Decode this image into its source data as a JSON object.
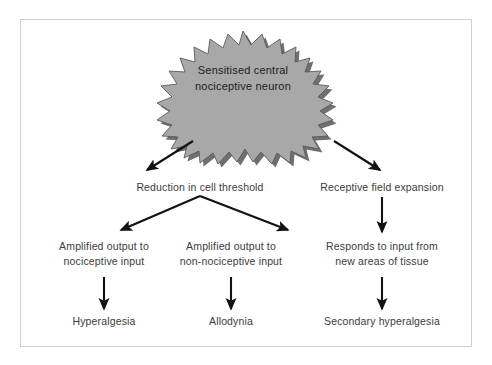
{
  "diagram": {
    "type": "flowchart",
    "title": "Sensitised central nociceptive neuron",
    "frame": {
      "border_color": "#cfcfcf",
      "background": "#ffffff"
    },
    "burst": {
      "shape": "starburst",
      "fill_color": "#a8a8a8",
      "shadow_color": "#6f6f6f",
      "outline_color": "#5a5a5a",
      "text_color": "#1c1c1c",
      "line1": "Sensitised central",
      "line2": "nociceptive neuron"
    },
    "arrow_color": "#121212",
    "label_color": "#3b3b3b",
    "tier1": [
      {
        "id": "reduction",
        "text": "Reduction in cell threshold"
      },
      {
        "id": "receptive",
        "text": "Receptive field expansion"
      }
    ],
    "tier2": [
      {
        "id": "amp-noci",
        "line1": "Amplified output to",
        "line2": "nociceptive input"
      },
      {
        "id": "amp-nonnoci",
        "line1": "Amplified output to",
        "line2": "non-nociceptive input"
      },
      {
        "id": "responds",
        "line1": "Responds to input from",
        "line2": "new areas of tissue"
      }
    ],
    "tier3": [
      {
        "id": "hyperalgesia",
        "text": "Hyperalgesia"
      },
      {
        "id": "allodynia",
        "text": "Allodynia"
      },
      {
        "id": "secondary",
        "text": "Secondary hyperalgesia"
      }
    ],
    "connectors": [
      {
        "id": "burst-to-reduction",
        "from": "burst",
        "to": "reduction",
        "style": "diagonal-arrow"
      },
      {
        "id": "burst-to-receptive",
        "from": "burst",
        "to": "receptive",
        "style": "diagonal-arrow"
      },
      {
        "id": "reduction-split-left",
        "from": "reduction",
        "to": "amp-noci",
        "style": "diagonal-arrow"
      },
      {
        "id": "reduction-split-right",
        "from": "reduction",
        "to": "amp-nonnoci",
        "style": "diagonal-arrow"
      },
      {
        "id": "receptive-to-responds",
        "from": "receptive",
        "to": "responds",
        "style": "vertical-arrow"
      },
      {
        "id": "amp-noci-to-hyperalgesia",
        "from": "amp-noci",
        "to": "hyperalgesia",
        "style": "vertical-arrow"
      },
      {
        "id": "amp-nonnoci-to-allodynia",
        "from": "amp-nonnoci",
        "to": "allodynia",
        "style": "vertical-arrow"
      },
      {
        "id": "responds-to-secondary",
        "from": "responds",
        "to": "secondary",
        "style": "vertical-arrow"
      }
    ]
  }
}
